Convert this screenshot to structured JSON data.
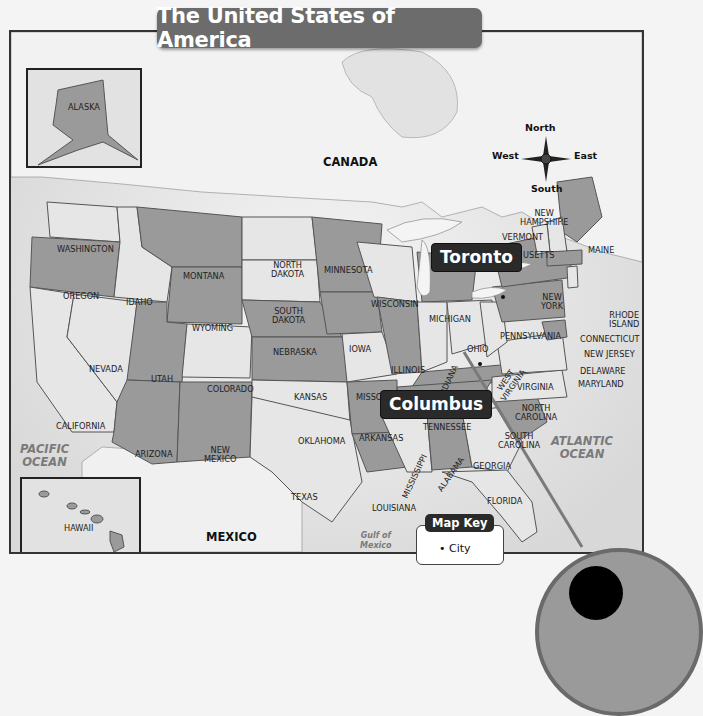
{
  "title": "The United States of America",
  "countries": {
    "canada": "CANADA",
    "mexico": "MEXICO"
  },
  "water": {
    "pacific": "PACIFIC OCEAN",
    "pacific_line1": "PACIFIC",
    "pacific_line2": "OCEAN",
    "atlantic_line1": "ATLANTIC",
    "atlantic_line2": "OCEAN",
    "gulf_line1": "Gulf of",
    "gulf_line2": "Mexico"
  },
  "compass": {
    "north": "North",
    "south": "South",
    "east": "East",
    "west": "West"
  },
  "insets": {
    "alaska": "ALASKA",
    "hawaii": "HAWAII"
  },
  "cities": [
    {
      "name": "Toronto"
    },
    {
      "name": "Columbus"
    }
  ],
  "map_key": {
    "title": "Map Key",
    "items": [
      {
        "symbol": "dot",
        "label": "City"
      }
    ]
  },
  "colors": {
    "dark_state": "#9a9a9a",
    "light_state": "#e6e6e6",
    "water": "#e9e9e9",
    "banner": "#6c6c6c",
    "callout": "#2a2a2a"
  },
  "states": {
    "washington": "WASHINGTON",
    "oregon": "OREGON",
    "california": "CALIFORNIA",
    "nevada": "NEVADA",
    "idaho": "IDAHO",
    "montana": "MONTANA",
    "wyoming": "WYOMING",
    "utah": "UTAH",
    "arizona": "ARIZONA",
    "colorado": "COLORADO",
    "new_mexico_1": "NEW",
    "new_mexico_2": "MEXICO",
    "north_dakota_1": "NORTH",
    "north_dakota_2": "DAKOTA",
    "south_dakota_1": "SOUTH",
    "south_dakota_2": "DAKOTA",
    "nebraska": "NEBRASKA",
    "kansas": "KANSAS",
    "oklahoma": "OKLAHOMA",
    "texas": "TEXAS",
    "minnesota": "MINNESOTA",
    "iowa": "IOWA",
    "missouri": "MISSO",
    "arkansas": "ARKANSAS",
    "louisiana": "LOUISIANA",
    "wisconsin": "WISCONSIN",
    "illinois": "ILLINOIS",
    "michigan": "MICHIGAN",
    "indiana": "INDIANA",
    "ohio": "OHIO",
    "kentucky": "",
    "tennessee": "TENNESSEE",
    "mississippi": "MISSISSIPPI",
    "alabama": "ALABAMA",
    "georgia": "GEORGIA",
    "florida": "FLORIDA",
    "south_carolina_1": "SOUTH",
    "south_carolina_2": "CAROLINA",
    "north_carolina_1": "NORTH",
    "north_carolina_2": "CAROLINA",
    "virginia": "VIRGINIA",
    "west_virginia_1": "WEST",
    "west_virginia_2": "VIRGINIA",
    "pennsylvania": "PENNSYLVANIA",
    "new_york_1": "NEW",
    "new_york_2": "YORK",
    "vermont": "VERMONT",
    "new_hampshire_1": "NEW",
    "new_hampshire_2": "HAMPSHIRE",
    "massachusetts": "USETTS",
    "maine": "MAINE",
    "rhode_island_1": "RHODE",
    "rhode_island_2": "ISLAND",
    "connecticut": "CONNECTICUT",
    "new_jersey": "NEW JERSEY",
    "delaware": "DELAWARE",
    "maryland": "MARYLAND"
  }
}
